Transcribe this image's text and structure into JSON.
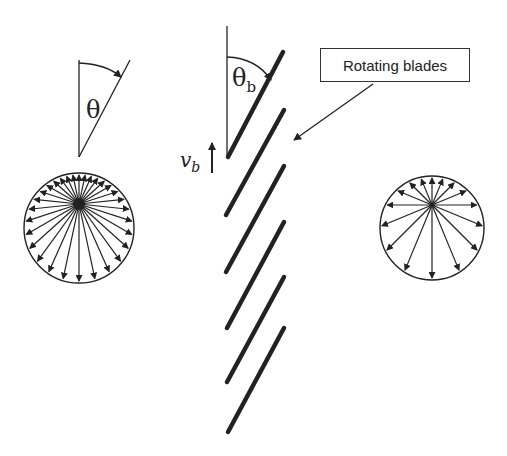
{
  "diagram": {
    "left_angle_label": "θ",
    "blade_angle_label": "θ",
    "blade_angle_subscript": "b",
    "velocity_label": "v",
    "velocity_subscript": "b",
    "callout_label": "Rotating blades",
    "colors": {
      "ink": "#222222",
      "background": "#ffffff"
    },
    "left_distribution": {
      "center": [
        79,
        228
      ],
      "radius": 55,
      "origin": [
        79,
        204
      ],
      "arrows": 30
    },
    "right_distribution": {
      "center": [
        432,
        228
      ],
      "radius": 52,
      "origin": [
        432,
        205
      ],
      "arrows": 16
    },
    "blades": [
      {
        "from": [
          228,
          157
        ],
        "to": [
          283,
          52
        ]
      },
      {
        "from": [
          226,
          215
        ],
        "to": [
          284,
          110
        ]
      },
      {
        "from": [
          226,
          272
        ],
        "to": [
          284,
          166
        ]
      },
      {
        "from": [
          227,
          328
        ],
        "to": [
          284,
          222
        ]
      },
      {
        "from": [
          227,
          382
        ],
        "to": [
          284,
          277
        ]
      },
      {
        "from": [
          228,
          432
        ],
        "to": [
          284,
          328
        ]
      }
    ]
  }
}
